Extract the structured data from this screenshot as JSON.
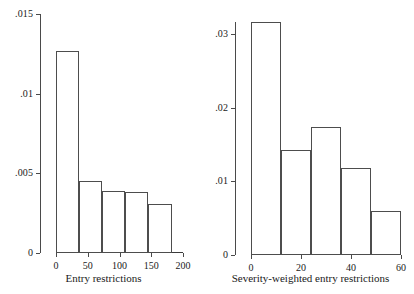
{
  "figure": {
    "background": "#ffffff",
    "line_color": "#4a4a4a",
    "bar_fill": "#ffffff",
    "bar_edge": "#4d4d4d"
  },
  "chart_data": [
    {
      "type": "bar",
      "id": "entry-restrictions-histogram",
      "title": "",
      "xlabel": "Entry restrictions",
      "ylabel": "",
      "xlim": [
        0,
        200
      ],
      "ylim": [
        0,
        0.015
      ],
      "xticks": [
        0,
        50,
        100,
        150,
        200
      ],
      "xticklabels": [
        "0",
        "50",
        "100",
        "150",
        "200"
      ],
      "yticks": [
        0,
        0.005,
        0.01,
        0.015
      ],
      "yticklabels": [
        "0",
        ".005",
        ".01",
        ".015"
      ],
      "grid": false,
      "legend": "none",
      "bin_edges": [
        0,
        36.4,
        72.8,
        109.2,
        145.6,
        182.0
      ],
      "values": [
        0.01265,
        0.00455,
        0.0039,
        0.00385,
        0.0031
      ],
      "bars": [
        {
          "x0": 0.0,
          "x1": 36.4,
          "density": 0.01265
        },
        {
          "x0": 36.4,
          "x1": 72.8,
          "density": 0.00455
        },
        {
          "x0": 72.8,
          "x1": 109.2,
          "density": 0.0039
        },
        {
          "x0": 109.2,
          "x1": 145.6,
          "density": 0.00385
        },
        {
          "x0": 145.6,
          "x1": 182.0,
          "density": 0.0031
        }
      ]
    },
    {
      "type": "bar",
      "id": "severity-weighted-entry-restrictions-histogram",
      "title": "",
      "xlabel": "Severity-weighted entry restrictions",
      "ylabel": "",
      "xlim": [
        0,
        60
      ],
      "ylim": [
        0,
        0.0316
      ],
      "xticks": [
        0,
        20,
        40,
        60
      ],
      "xticklabels": [
        "0",
        "20",
        "40",
        "60"
      ],
      "yticks": [
        0,
        0.01,
        0.02,
        0.03
      ],
      "yticklabels": [
        "0",
        ".01",
        ".02",
        ".03"
      ],
      "grid": false,
      "legend": "none",
      "bin_edges": [
        0,
        12,
        24,
        36,
        48,
        60
      ],
      "values": [
        0.0316,
        0.0143,
        0.0173,
        0.0118,
        0.006
      ],
      "bars": [
        {
          "x0": 0,
          "x1": 12,
          "density": 0.0316
        },
        {
          "x0": 12,
          "x1": 24,
          "density": 0.0143
        },
        {
          "x0": 24,
          "x1": 36,
          "density": 0.0173
        },
        {
          "x0": 36,
          "x1": 48,
          "density": 0.0118
        },
        {
          "x0": 48,
          "x1": 60,
          "density": 0.006
        }
      ]
    }
  ]
}
